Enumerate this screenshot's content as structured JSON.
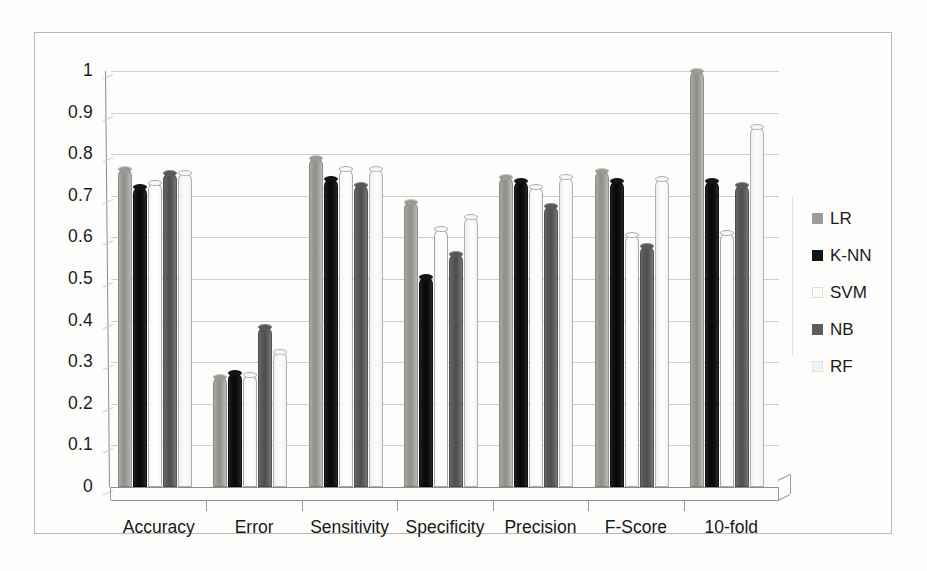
{
  "chart_data": {
    "type": "bar",
    "title": "",
    "xlabel": "",
    "ylabel": "",
    "ylim": [
      0,
      1
    ],
    "yticks": [
      "0",
      "0.1",
      "0.2",
      "0.3",
      "0.4",
      "0.5",
      "0.6",
      "0.7",
      "0.8",
      "0.9",
      "1"
    ],
    "grid": true,
    "legend_position": "right",
    "categories": [
      "Accuracy",
      "Error",
      "Sensitivity",
      "Specificity",
      "Precision",
      "F-Score",
      "10-fold"
    ],
    "series": [
      {
        "name": "LR",
        "color": "#9d9d9a",
        "values": [
          0.765,
          0.265,
          0.79,
          0.685,
          0.745,
          0.76,
          1.0
        ]
      },
      {
        "name": "K-NN",
        "color": "#141413",
        "values": [
          0.72,
          0.275,
          0.74,
          0.505,
          0.735,
          0.735,
          0.735
        ]
      },
      {
        "name": "SVM",
        "color": "#fbfbfa",
        "values": [
          0.73,
          0.27,
          0.765,
          0.62,
          0.72,
          0.605,
          0.61
        ]
      },
      {
        "name": "NB",
        "color": "#5c5c5a",
        "values": [
          0.755,
          0.385,
          0.725,
          0.56,
          0.675,
          0.58,
          0.725
        ]
      },
      {
        "name": "RF",
        "color": "#f2f2f0",
        "values": [
          0.755,
          0.325,
          0.765,
          0.65,
          0.745,
          0.74,
          0.865
        ]
      }
    ]
  },
  "legend": {
    "items": [
      {
        "label": "LR"
      },
      {
        "label": "K-NN"
      },
      {
        "label": "SVM"
      },
      {
        "label": "NB"
      },
      {
        "label": "RF"
      }
    ]
  }
}
